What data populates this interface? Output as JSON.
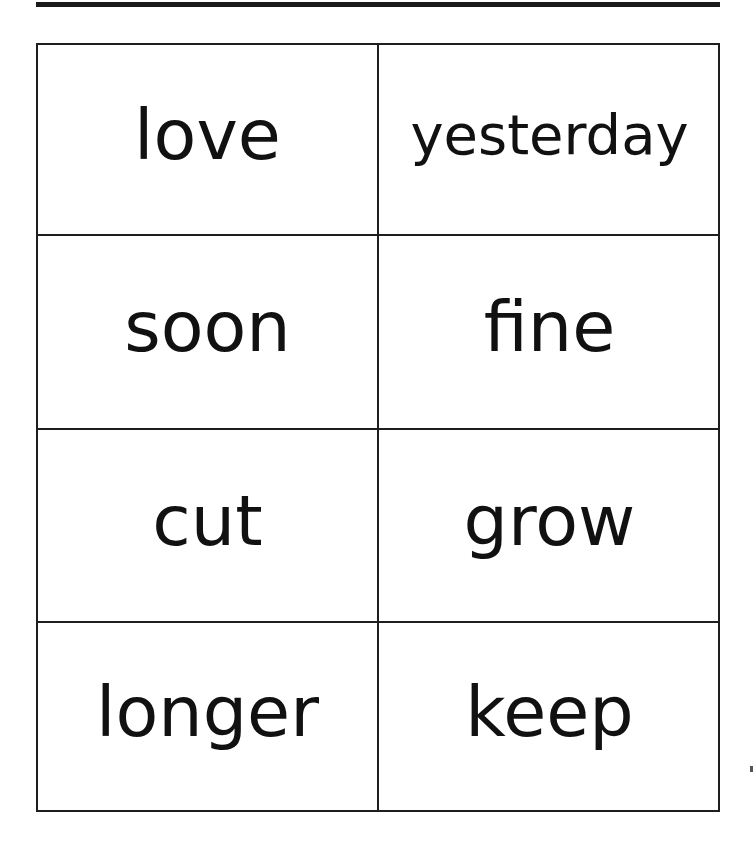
{
  "document": {
    "type": "word flash cards",
    "cards": [
      {
        "word": "love"
      },
      {
        "word": "yesterday"
      },
      {
        "word": "soon"
      },
      {
        "word": "fine"
      },
      {
        "word": "cut"
      },
      {
        "word": "grow"
      },
      {
        "word": "longer"
      },
      {
        "word": "keep"
      }
    ],
    "layout": {
      "columns": 2,
      "rows": 4
    },
    "colors": {
      "ink": "#111111",
      "border": "#1e1e1e",
      "paper": "#ffffff"
    }
  }
}
